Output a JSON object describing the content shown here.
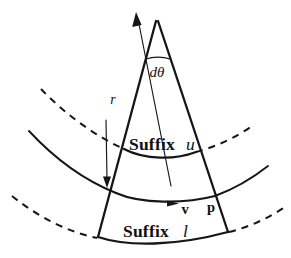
{
  "figure": {
    "background_color": "#ffffff",
    "ink_color": "#161616",
    "width": 291,
    "height": 258
  },
  "labels": {
    "angle": "dθ",
    "radius": "r",
    "suffix_word": "Suffix",
    "suffix_upper_symbol": "u",
    "suffix_lower_symbol": "l",
    "velocity": "v",
    "pressure": "p"
  },
  "annotations": [
    {
      "name": "angle-label",
      "text": "dθ",
      "x": 157,
      "y": 76
    },
    {
      "name": "radius-label",
      "text": "r",
      "x": 111,
      "y": 102
    },
    {
      "name": "suffix-upper-word",
      "text": "Suffix",
      "x": 131,
      "y": 150
    },
    {
      "name": "suffix-upper-symbol",
      "text": "u",
      "x": 188,
      "y": 150
    },
    {
      "name": "velocity-label",
      "text": "v",
      "x": 185,
      "y": 212
    },
    {
      "name": "pressure-label",
      "text": "p",
      "x": 210,
      "y": 211
    },
    {
      "name": "suffix-lower-word",
      "text": "Suffix",
      "x": 125,
      "y": 236
    },
    {
      "name": "suffix-lower-symbol",
      "text": "l",
      "x": 185,
      "y": 236
    }
  ],
  "geometry": {
    "apex": {
      "x": 157,
      "y": 20
    },
    "sector_bottom_left": {
      "x": 98,
      "y": 237
    },
    "sector_bottom_right": {
      "x": 228,
      "y": 232
    },
    "arc_upper_suffix_y": 157,
    "arc_middle_y": 199,
    "arc_lower_y": 238,
    "radius_arrow_tip": {
      "x": 136,
      "y": 13
    },
    "radius_arrow_tail": {
      "x": 172,
      "y": 186
    }
  }
}
